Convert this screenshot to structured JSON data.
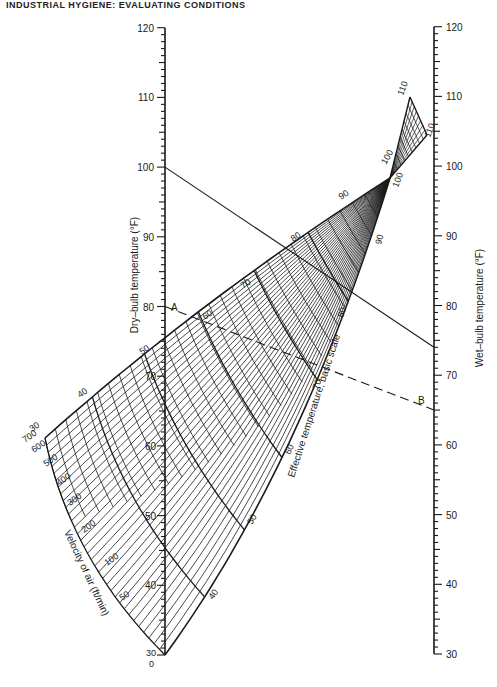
{
  "header": {
    "text": "INDUSTRIAL HYGIENE: EVALUATING CONDITIONS"
  },
  "chart_data": {
    "type": "nomogram",
    "left_axis": {
      "label": "Dry–bulb temperature (°F)",
      "ticks": [
        30,
        40,
        50,
        60,
        70,
        80,
        90,
        100,
        110,
        120
      ],
      "range": [
        30,
        120
      ]
    },
    "right_axis": {
      "label": "Wet–bulb temperature (°F)",
      "ticks": [
        30,
        40,
        50,
        60,
        70,
        80,
        90,
        100,
        110,
        120
      ],
      "range": [
        30,
        120
      ]
    },
    "effective_temperature": {
      "label": "Effective temperature, basic scale",
      "upper_labels": [
        "40",
        "50",
        "60",
        "70",
        "80",
        "90",
        "100",
        "110"
      ],
      "lower_labels": [
        "40",
        "50",
        "60",
        "70",
        "80",
        "90",
        "100",
        "110"
      ]
    },
    "velocity": {
      "label": "Velocity of air (ft/min)",
      "values": [
        "0",
        "30",
        "50",
        "100",
        "200",
        "300",
        "400",
        "500",
        "600",
        "700"
      ],
      "upper_edge_label": "30"
    },
    "inner_dry_bulb_labels": [
      "40",
      "50",
      "60",
      "70"
    ],
    "example_lines": [
      {
        "name": "solid",
        "dry_bulb": 100,
        "wet_bulb": 74,
        "style": "solid"
      },
      {
        "name": "A–B",
        "dry_bulb": 80,
        "wet_bulb": 65,
        "style": "dashed",
        "start_label": "A",
        "end_label": "B"
      }
    ]
  }
}
